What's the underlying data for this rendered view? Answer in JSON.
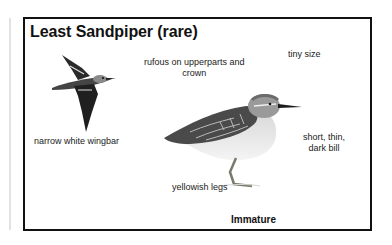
{
  "plate": {
    "title": "Least Sandpiper (rare)",
    "labels": {
      "wingbar": "narrow white wingbar",
      "upperparts_line1": "rufous on upperparts and",
      "upperparts_line2": "crown",
      "size": "tiny size",
      "bill_line1": "short, thin,",
      "bill_line2": "dark bill",
      "legs": "yellowish legs"
    },
    "caption": "Immature",
    "illustrations": {
      "flying": "flying-sandpiper-illustration",
      "standing": "standing-sandpiper-illustration"
    }
  }
}
